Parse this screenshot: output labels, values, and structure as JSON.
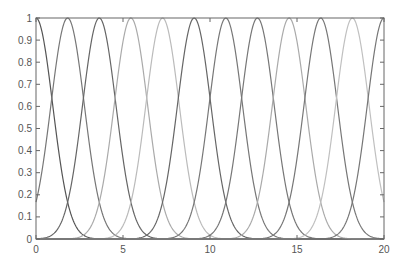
{
  "chart_data": {
    "type": "line",
    "title": "",
    "xlabel": "",
    "ylabel": "",
    "xlim": [
      0,
      20
    ],
    "ylim": [
      0,
      1
    ],
    "grid": false,
    "legend": null,
    "x_ticks": [
      0,
      5,
      10,
      15,
      20
    ],
    "x_tick_labels": [
      "0",
      "5",
      "10",
      "15",
      "20"
    ],
    "y_ticks": [
      0,
      0.1,
      0.2,
      0.3,
      0.4,
      0.5,
      0.6,
      0.7,
      0.8,
      0.9,
      1
    ],
    "y_tick_labels": [
      "0",
      "0.1",
      "0.2",
      "0.3",
      "0.4",
      "0.5",
      "0.6",
      "0.7",
      "0.8",
      "0.9",
      "1"
    ],
    "series": [
      {
        "name": "mf1",
        "center": 0.0,
        "sigma": 0.96,
        "color": "#555555"
      },
      {
        "name": "mf2",
        "center": 1.818,
        "sigma": 0.96,
        "color": "#777777"
      },
      {
        "name": "mf3",
        "center": 3.636,
        "sigma": 0.96,
        "color": "#666666"
      },
      {
        "name": "mf4",
        "center": 5.455,
        "sigma": 0.96,
        "color": "#aaaaaa"
      },
      {
        "name": "mf5",
        "center": 7.273,
        "sigma": 0.96,
        "color": "#bbbbbb"
      },
      {
        "name": "mf6",
        "center": 9.091,
        "sigma": 0.96,
        "color": "#666666"
      },
      {
        "name": "mf7",
        "center": 10.909,
        "sigma": 0.96,
        "color": "#777777"
      },
      {
        "name": "mf8",
        "center": 12.727,
        "sigma": 0.96,
        "color": "#777777"
      },
      {
        "name": "mf9",
        "center": 14.545,
        "sigma": 0.96,
        "color": "#aaaaaa"
      },
      {
        "name": "mf10",
        "center": 16.364,
        "sigma": 0.96,
        "color": "#777777"
      },
      {
        "name": "mf11",
        "center": 18.182,
        "sigma": 0.96,
        "color": "#c0c0c0"
      },
      {
        "name": "mf12",
        "center": 20.0,
        "sigma": 0.96,
        "color": "#777777"
      }
    ]
  },
  "plot": {
    "left": 36,
    "top": 18,
    "right": 384,
    "bottom": 239,
    "axis_color": "#666666"
  }
}
